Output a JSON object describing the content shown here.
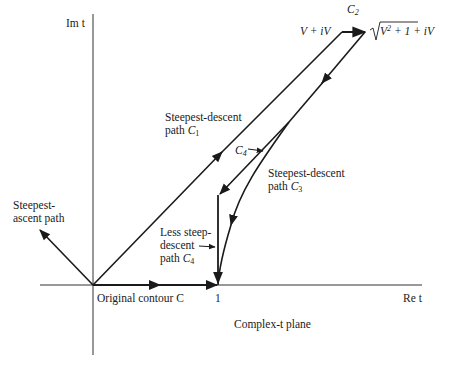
{
  "diagram": {
    "caption": "Complex-t plane",
    "axes": {
      "imag_label": "Im t",
      "real_label": "Re t",
      "tick_one": "1"
    },
    "labels": {
      "original_contour": "Original contour C",
      "steepest_ascent_line1": "Steepest-",
      "steepest_ascent_line2": "ascent path",
      "c1_line1": "Steepest-descent",
      "c1_line2_prefix": "path ",
      "c1_symbol": "C",
      "c1_sub": "1",
      "c2_symbol": "C",
      "c2_sub": "2",
      "c3_line1": "Steepest-descent",
      "c3_line2_prefix": "path ",
      "c3_symbol": "C",
      "c3_sub": "3",
      "c4_symbol": "C",
      "c4_sub": "4",
      "less_steep_line1": "Less steep-",
      "less_steep_line2": "descent",
      "less_steep_line3_prefix": "path ",
      "less_steep_symbol": "C",
      "less_steep_sub": "4",
      "corner_left": "V + iV",
      "corner_right_sqrt": "V",
      "corner_right_exp": "2",
      "corner_right_rest": " + 1 + iV"
    }
  }
}
